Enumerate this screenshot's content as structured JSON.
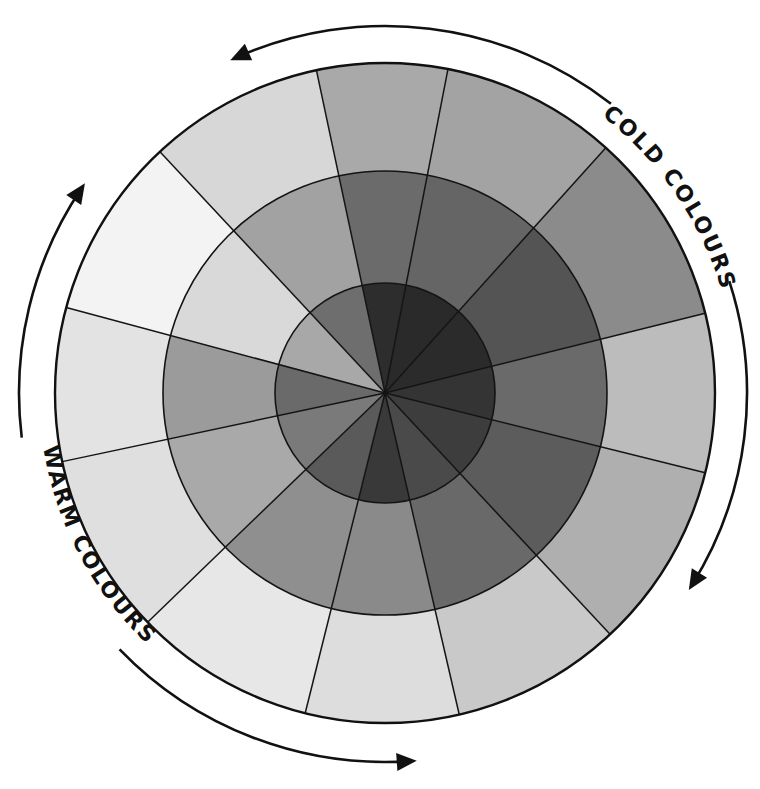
{
  "diagram": {
    "type": "colour-wheel",
    "center": [
      385,
      393
    ],
    "radii": {
      "inner": 110,
      "middle": 222,
      "outer": 330
    },
    "labels": {
      "cold": "COLD COLOURS",
      "warm": "WARM COLOURS"
    },
    "segments": [
      {
        "start": 258,
        "end": 281,
        "outer": "#a9a9a9",
        "middle": "#6b6b6b",
        "inner": "#2d2d2d"
      },
      {
        "start": 281,
        "end": 312,
        "outer": "#a3a3a3",
        "middle": "#656565",
        "inner": "#2a2a2a"
      },
      {
        "start": 312,
        "end": 346,
        "outer": "#8b8b8b",
        "middle": "#545454",
        "inner": "#2b2b2b"
      },
      {
        "start": 346,
        "end": 374,
        "outer": "#bcbcbc",
        "middle": "#6a6a6a",
        "inner": "#343434"
      },
      {
        "start": 14,
        "end": 47,
        "outer": "#afafaf",
        "middle": "#5c5c5c",
        "inner": "#3d3d3d"
      },
      {
        "start": 47,
        "end": 77,
        "outer": "#c9c9c9",
        "middle": "#696969",
        "inner": "#4a4a4a"
      },
      {
        "start": 77,
        "end": 104,
        "outer": "#dddddd",
        "middle": "#8a8a8a",
        "inner": "#393939"
      },
      {
        "start": 104,
        "end": 136,
        "outer": "#e7e7e7",
        "middle": "#8f8f8f",
        "inner": "#5a5a5a"
      },
      {
        "start": 136,
        "end": 168,
        "outer": "#dfdfdf",
        "middle": "#a9a9a9",
        "inner": "#7a7a7a"
      },
      {
        "start": 168,
        "end": 195,
        "outer": "#e3e3e3",
        "middle": "#9b9b9b",
        "inner": "#6a6a6a"
      },
      {
        "start": 195,
        "end": 227,
        "outer": "#f3f3f3",
        "middle": "#d9d9d9",
        "inner": "#a8a8a8"
      },
      {
        "start": 227,
        "end": 258,
        "outer": "#d7d7d7",
        "middle": "#a2a2a2",
        "inner": "#6e6e6e"
      }
    ],
    "arrows": [
      {
        "name": "top-arrow",
        "from": -52,
        "to": -114,
        "radius": 367
      },
      {
        "name": "right-arrow",
        "from": -18,
        "to": 32,
        "radius": 362
      },
      {
        "name": "bottom-arrow",
        "from": 136,
        "to": 86,
        "radius": 369
      },
      {
        "name": "left-arrow",
        "from": 173,
        "to": 214,
        "radius": 366
      }
    ]
  }
}
